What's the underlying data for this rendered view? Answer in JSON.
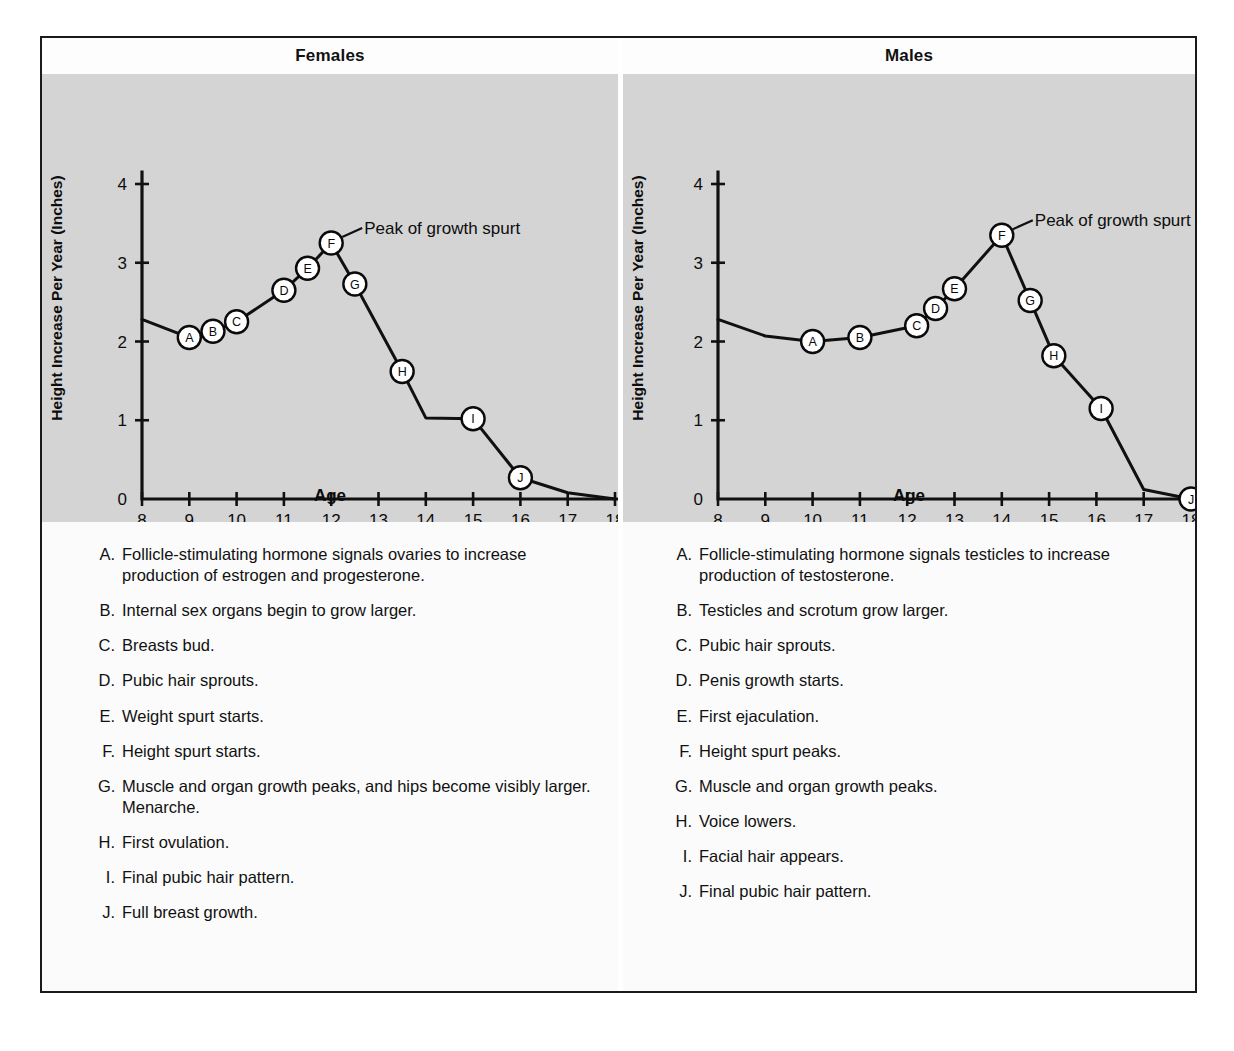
{
  "figure": {
    "panels": [
      {
        "id": "females",
        "title": "Females",
        "annotation": "Peak of growth spurt",
        "legend": [
          {
            "key": "A.",
            "text": "Follicle-stimulating hormone signals ovaries to increase production of estrogen and progesterone."
          },
          {
            "key": "B.",
            "text": "Internal sex organs begin to grow larger."
          },
          {
            "key": "C.",
            "text": "Breasts bud."
          },
          {
            "key": "D.",
            "text": "Pubic hair sprouts."
          },
          {
            "key": "E.",
            "text": "Weight spurt starts."
          },
          {
            "key": "F.",
            "text": "Height spurt starts."
          },
          {
            "key": "G.",
            "text": "Muscle and organ growth peaks, and hips become visibly larger. Menarche."
          },
          {
            "key": "H.",
            "text": "First ovulation."
          },
          {
            "key": "I.",
            "text": "Final pubic hair pattern."
          },
          {
            "key": "J.",
            "text": "Full breast growth."
          }
        ]
      },
      {
        "id": "males",
        "title": "Males",
        "annotation": "Peak of growth spurt",
        "legend": [
          {
            "key": "A.",
            "text": "Follicle-stimulating hormone signals testicles to increase production of testosterone."
          },
          {
            "key": "B.",
            "text": "Testicles and scrotum grow larger."
          },
          {
            "key": "C.",
            "text": "Pubic hair sprouts."
          },
          {
            "key": "D.",
            "text": "Penis growth starts."
          },
          {
            "key": "E.",
            "text": "First ejaculation."
          },
          {
            "key": "F.",
            "text": "Height spurt peaks."
          },
          {
            "key": "G.",
            "text": "Muscle and organ growth peaks."
          },
          {
            "key": "H.",
            "text": "Voice lowers."
          },
          {
            "key": "I.",
            "text": "Facial hair appears."
          },
          {
            "key": "J.",
            "text": "Final pubic hair pattern."
          }
        ]
      }
    ],
    "colors": {
      "chart_background": "#d4d4d4",
      "panel_background": "#fbfbfb",
      "line": "#101010",
      "frame": "#1a1a1a"
    }
  },
  "chart_data": [
    {
      "type": "line",
      "title": "Females",
      "xlabel": "Age",
      "ylabel": "Height Increase Per Year (Inches)",
      "xlim": [
        8,
        18
      ],
      "ylim": [
        0,
        4
      ],
      "xticks": [
        8,
        9,
        10,
        11,
        12,
        13,
        14,
        15,
        16,
        17,
        18
      ],
      "yticks": [
        0,
        1,
        2,
        3,
        4
      ],
      "grid": false,
      "legend_position": "below-plot",
      "annotations": [
        {
          "text": "Peak of growth spurt",
          "points_to_marker": "F",
          "x": 12.0,
          "y": 3.25
        }
      ],
      "x": [
        8.0,
        9.0,
        9.5,
        10.0,
        11.0,
        11.5,
        12.0,
        12.5,
        13.5,
        14.0,
        15.0,
        16.0,
        17.0,
        18.0
      ],
      "y": [
        2.28,
        2.05,
        2.13,
        2.25,
        2.65,
        2.93,
        3.25,
        2.73,
        1.62,
        1.03,
        1.02,
        0.27,
        0.08,
        0.0
      ],
      "markers": [
        {
          "label": "A",
          "x": 9.0,
          "y": 2.05
        },
        {
          "label": "B",
          "x": 9.5,
          "y": 2.13
        },
        {
          "label": "C",
          "x": 10.0,
          "y": 2.25
        },
        {
          "label": "D",
          "x": 11.0,
          "y": 2.65
        },
        {
          "label": "E",
          "x": 11.5,
          "y": 2.93
        },
        {
          "label": "F",
          "x": 12.0,
          "y": 3.25
        },
        {
          "label": "G",
          "x": 12.5,
          "y": 2.73
        },
        {
          "label": "H",
          "x": 13.5,
          "y": 1.62
        },
        {
          "label": "I",
          "x": 15.0,
          "y": 1.02
        },
        {
          "label": "J",
          "x": 16.0,
          "y": 0.27
        }
      ]
    },
    {
      "type": "line",
      "title": "Males",
      "xlabel": "Age",
      "ylabel": "Height Increase Per Year (Inches)",
      "xlim": [
        8,
        18
      ],
      "ylim": [
        0,
        4
      ],
      "xticks": [
        8,
        9,
        10,
        11,
        12,
        13,
        14,
        15,
        16,
        17,
        18
      ],
      "yticks": [
        0,
        1,
        2,
        3,
        4
      ],
      "grid": false,
      "legend_position": "below-plot",
      "annotations": [
        {
          "text": "Peak of growth spurt",
          "points_to_marker": "F",
          "x": 14.0,
          "y": 3.35
        }
      ],
      "x": [
        8.0,
        9.0,
        10.0,
        11.0,
        12.2,
        12.6,
        13.0,
        14.0,
        14.6,
        15.1,
        16.1,
        17.0,
        18.0
      ],
      "y": [
        2.28,
        2.07,
        2.0,
        2.05,
        2.2,
        2.42,
        2.67,
        3.35,
        2.52,
        1.82,
        1.15,
        0.12,
        0.0
      ],
      "markers": [
        {
          "label": "A",
          "x": 10.0,
          "y": 2.0
        },
        {
          "label": "B",
          "x": 11.0,
          "y": 2.05
        },
        {
          "label": "C",
          "x": 12.2,
          "y": 2.2
        },
        {
          "label": "D",
          "x": 12.6,
          "y": 2.42
        },
        {
          "label": "E",
          "x": 13.0,
          "y": 2.67
        },
        {
          "label": "F",
          "x": 14.0,
          "y": 3.35
        },
        {
          "label": "G",
          "x": 14.6,
          "y": 2.52
        },
        {
          "label": "H",
          "x": 15.1,
          "y": 1.82
        },
        {
          "label": "I",
          "x": 16.1,
          "y": 1.15
        },
        {
          "label": "J",
          "x": 18.0,
          "y": 0.0
        }
      ]
    }
  ]
}
